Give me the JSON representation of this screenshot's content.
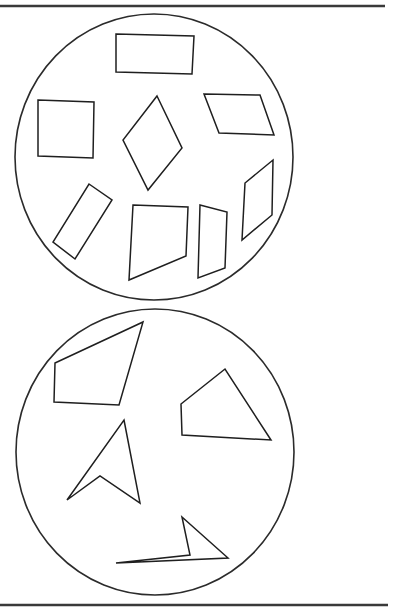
{
  "figure": {
    "width": 394,
    "height": 609,
    "background": "#ffffff",
    "line_color": "#1f1f1f",
    "rules": [
      {
        "name": "top-rule",
        "x1": 0,
        "y1": 6,
        "x2": 385,
        "y2": 6
      },
      {
        "name": "bottom-rule",
        "x1": 0,
        "y1": 605,
        "x2": 388,
        "y2": 605
      }
    ],
    "groups": [
      {
        "name": "top-circle-group",
        "description": "Convex quadrilaterals",
        "circle": {
          "cx": 154,
          "cy": 157,
          "rx": 139,
          "ry": 143
        },
        "shapes": [
          {
            "name": "rectangle",
            "points": "116,34 194,36 192,74 116,72"
          },
          {
            "name": "square",
            "points": "38,100 94,102 93,158 38,156"
          },
          {
            "name": "rhombus",
            "points": "157,96 182,148 148,190 123,140"
          },
          {
            "name": "parallelogram-horizontal",
            "points": "204,94 260,95 274,135 219,133"
          },
          {
            "name": "tilted-rectangle",
            "points": "89,184 112,200 75,259 53,242"
          },
          {
            "name": "trapezoid-wide",
            "points": "133,205 188,207 186,256 129,280"
          },
          {
            "name": "trapezoid-narrow",
            "points": "200,205 227,212 225,268 198,278"
          },
          {
            "name": "parallelogram-vertical",
            "points": "273,160 272,215 242,240 245,183"
          }
        ]
      },
      {
        "name": "bottom-circle-group",
        "description": "Other quadrilaterals",
        "circle": {
          "cx": 155,
          "cy": 452,
          "rx": 139,
          "ry": 143
        },
        "shapes": [
          {
            "name": "irregular-quadrilateral-left",
            "points": "55,363 143,322 119,405 54,402"
          },
          {
            "name": "irregular-quadrilateral-right",
            "points": "181,404 225,369 271,440 182,435"
          },
          {
            "name": "concave-arrowhead",
            "points": "124,420 140,503 100,476 67,500"
          },
          {
            "name": "concave-sliver",
            "points": "182,517 228,558 116,563 190,555"
          }
        ]
      }
    ]
  }
}
